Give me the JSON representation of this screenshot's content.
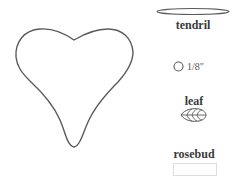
{
  "shapes": {
    "heart": {
      "name": "heart"
    },
    "tendril": {
      "label": "tendril"
    },
    "circle": {
      "size_label": "1/8\""
    },
    "leaf": {
      "label": "leaf"
    },
    "rosebud": {
      "label": "rosebud"
    }
  },
  "colors": {
    "stroke": "#5a5a5a",
    "label": "#3a3a3a",
    "box_border": "#dddddd"
  }
}
